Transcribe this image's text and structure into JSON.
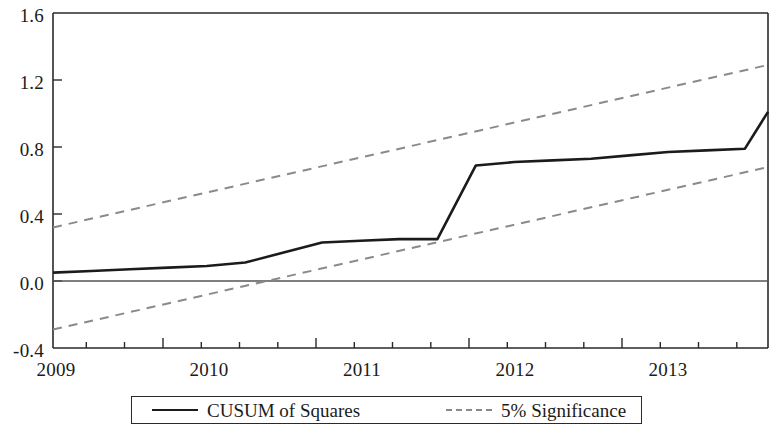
{
  "chart_data": {
    "type": "line",
    "title": "",
    "xlabel": "",
    "ylabel": "",
    "xlim": [
      2009.25,
      2013.9
    ],
    "ylim": [
      -0.4,
      1.6
    ],
    "grid": false,
    "legend_position": "bottom",
    "y_ticks": [
      "1.6",
      "1.2",
      "0.8",
      "0.4",
      "0.0",
      "-0.4"
    ],
    "y_tick_values": [
      1.6,
      1.2,
      0.8,
      0.4,
      0.0,
      -0.4
    ],
    "x_ticks": [
      "2009",
      "2010",
      "2011",
      "2012",
      "2013"
    ],
    "x_tick_values": [
      2009,
      2010,
      2011,
      2012,
      2013
    ],
    "x_minor_tick_interval": 0.25,
    "zero_line": 0.0,
    "series": [
      {
        "name": "CUSUM of Squares",
        "style": "solid",
        "color": "#1b1b1b",
        "x": [
          2009.25,
          2009.5,
          2009.75,
          2010.0,
          2010.25,
          2010.5,
          2010.75,
          2011.0,
          2011.25,
          2011.5,
          2011.75,
          2012.0,
          2012.25,
          2012.5,
          2012.75,
          2013.0,
          2013.25,
          2013.5,
          2013.75,
          2013.9
        ],
        "values": [
          0.05,
          0.06,
          0.07,
          0.08,
          0.09,
          0.11,
          0.17,
          0.23,
          0.24,
          0.25,
          0.25,
          0.69,
          0.71,
          0.72,
          0.73,
          0.75,
          0.77,
          0.78,
          0.79,
          1.01
        ]
      },
      {
        "name": "5% Significance",
        "style": "dashed",
        "color": "#8a8a8a",
        "bound": "upper",
        "x": [
          2009.25,
          2013.9
        ],
        "values": [
          0.32,
          1.29
        ]
      },
      {
        "name": "5% Significance",
        "style": "dashed",
        "color": "#8a8a8a",
        "bound": "lower",
        "x": [
          2009.25,
          2013.9
        ],
        "values": [
          -0.29,
          0.68
        ]
      }
    ],
    "legend": [
      {
        "label": "CUSUM of Squares",
        "style": "solid",
        "color": "#1b1b1b"
      },
      {
        "label": "5% Significance",
        "style": "dashed",
        "color": "#8a8a8a"
      }
    ]
  },
  "axis": {
    "y_labels": [
      {
        "text": "1.6",
        "top": 6
      },
      {
        "text": "1.2",
        "top": 73
      },
      {
        "text": "0.8",
        "top": 140
      },
      {
        "text": "0.4",
        "top": 207
      },
      {
        "text": "0.0",
        "top": 274
      },
      {
        "text": "-0.4",
        "top": 341
      }
    ],
    "x_labels": [
      {
        "text": "2009",
        "left": 52
      },
      {
        "text": "2010",
        "left": 205
      },
      {
        "text": "2011",
        "left": 358
      },
      {
        "text": "2012",
        "left": 511
      },
      {
        "text": "2013",
        "left": 664
      }
    ]
  },
  "legend": {
    "items": [
      {
        "label": "CUSUM of Squares"
      },
      {
        "label": "5% Significance"
      }
    ]
  }
}
